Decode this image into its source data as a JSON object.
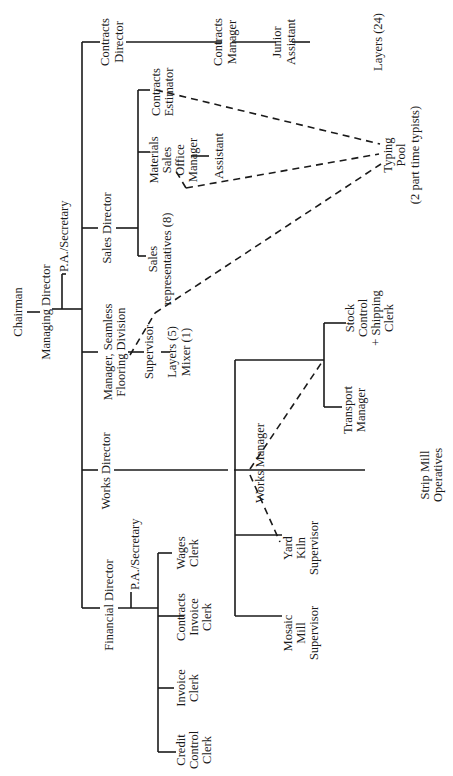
{
  "orientation": "rotated 90 degrees counter-clockwise",
  "colors": {
    "line": "#1a1a1a",
    "background": "#ffffff"
  },
  "nodes": {
    "chairman": [
      "Chairman"
    ],
    "managing_director": [
      "Managing Director"
    ],
    "md_pa": [
      "P.A./Secretary"
    ],
    "contracts_director": [
      "Contracts",
      "Director"
    ],
    "contracts_manager": [
      "Contracts",
      "Manager"
    ],
    "junior_assistant": [
      "Junior",
      "Assistant"
    ],
    "layers_24": [
      "Layers (24)"
    ],
    "sales_director": [
      "Sales Director"
    ],
    "sales_reps": [
      "Sales",
      "representatives (8)"
    ],
    "materials_sales_office_manager": [
      "Materials",
      "Sales",
      "Office",
      "Manager"
    ],
    "assistant": [
      "Assistant"
    ],
    "contracts_estimator": [
      "Contracts",
      "Estimator"
    ],
    "typing_pool": [
      "Typing",
      "Pool",
      "(2 part time typists)"
    ],
    "seamless_manager": [
      "Manager, Seamless",
      "Flooring Division"
    ],
    "supervisor": [
      "Supervisor"
    ],
    "layers_mixer": [
      "Layers (5)",
      "Mixer (1)"
    ],
    "works_director": [
      "Works Director"
    ],
    "works_manager": [
      "Works Manager"
    ],
    "transport_manager": [
      "Transport",
      "Manager"
    ],
    "stock_control": [
      "Stock",
      "Control",
      "+ Shipping",
      "Clerk"
    ],
    "yard_kiln_supervisor": [
      "Yard",
      "Kiln",
      "Supervisor"
    ],
    "mosaic_mill_supervisor": [
      "Mosaic",
      "Mill",
      "Supervisor"
    ],
    "strip_mill": [
      "Strip Mill",
      "Operatives"
    ],
    "financial_director": [
      "Financial Director"
    ],
    "fd_pa": [
      "P.A./Secretary"
    ],
    "wages_clerk": [
      "Wages",
      "Clerk"
    ],
    "contracts_invoice_clerk": [
      "Contracts",
      "Invoice",
      "Clerk"
    ],
    "invoice_clerk": [
      "Invoice",
      "Clerk"
    ],
    "credit_control_clerk": [
      "Credit",
      "Control",
      "Clerk"
    ]
  }
}
